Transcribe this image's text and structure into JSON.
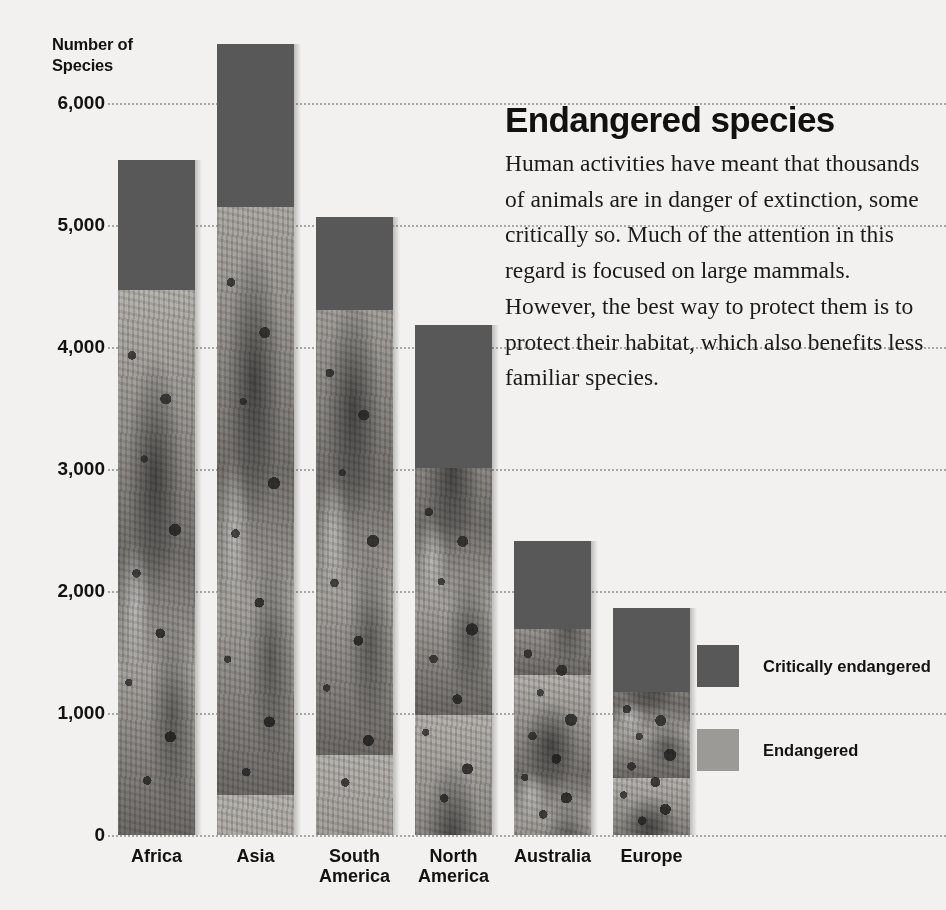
{
  "chart_data": {
    "type": "bar",
    "title": "Endangered species",
    "stacked": true,
    "ylabel": "Number of Species",
    "xlabel": "",
    "ylim": [
      0,
      6500
    ],
    "yticks": [
      0,
      1000,
      2000,
      3000,
      4000,
      5000,
      6000
    ],
    "ytick_labels": [
      "0",
      "1,000",
      "2,000",
      "3,000",
      "4,000",
      "5,000",
      "6,000"
    ],
    "grid": "horizontal-dotted",
    "legend_position": "right",
    "categories": [
      "Africa",
      "Asia",
      "South America",
      "North America",
      "Australia",
      "Europe"
    ],
    "series": [
      {
        "name": "Endangered",
        "color": "#9b9a96",
        "values": [
          4470,
          5150,
          4300,
          3010,
          1690,
          1170
        ]
      },
      {
        "name": "Critically endangered",
        "color": "#585858",
        "values": [
          1060,
          1330,
          765,
          1170,
          720,
          690
        ]
      }
    ],
    "totals": [
      5530,
      6480,
      5065,
      4180,
      2410,
      1860
    ]
  },
  "chart": {
    "axis_title_line1": "Number of",
    "axis_title_line2": "Species",
    "x_labels": [
      "Africa",
      "Asia",
      "South\nAmerica",
      "North\nAmerica",
      "Australia",
      "Europe"
    ]
  },
  "article": {
    "heading": "Endangered species",
    "body": "Human activities have meant that thousands of animals are in danger of extinction, some critically so. Much of the attention in this regard is focused on large mammals. However, the best way to protect them is to protect their habitat, which also benefits less familiar species."
  },
  "legend": {
    "items": [
      {
        "label": "Critically endangered",
        "color": "#585858"
      },
      {
        "label": "Endangered",
        "color": "#9b9a96"
      }
    ]
  }
}
